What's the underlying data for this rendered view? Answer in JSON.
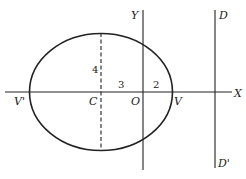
{
  "diagram": {
    "type": "ellipse-with-directrix",
    "colors": {
      "stroke": "#222222",
      "background": "#ffffff"
    },
    "axes": {
      "x_axis_label": "X",
      "y_axis_label": "Y"
    },
    "points": {
      "center": "C",
      "origin": "O",
      "right_vertex": "V",
      "left_vertex": "V'"
    },
    "directrix": {
      "top_label": "D",
      "bottom_label": "D'"
    },
    "measurements": {
      "semi_minor": "4",
      "center_to_origin": "3",
      "origin_to_vertex": "2"
    }
  }
}
